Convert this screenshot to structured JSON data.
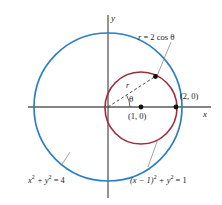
{
  "figure": {
    "axes": {
      "x_label": "x",
      "y_label": "y",
      "axis_color": "#5a5a5a",
      "origin": {
        "x": 108,
        "y": 107
      }
    },
    "curves": [
      {
        "name": "outer-circle",
        "equation": "x2 + y2 = 4",
        "equation_parts": {
          "lead": "x",
          "exp1": "2",
          "mid": " + y",
          "exp2": "2",
          "tail": " = 4"
        },
        "color": "#2b7fc4",
        "center": {
          "x": 108,
          "y": 107
        },
        "radius": 74
      },
      {
        "name": "inner-circle",
        "equation": "(x - 1)2 + y2 = 1",
        "equation_parts": {
          "lead": "(x − 1)",
          "exp1": "2",
          "mid": " + y",
          "exp2": "2",
          "tail": " = 1"
        },
        "color": "#a02a3c",
        "center": {
          "x": 141,
          "y": 108
        },
        "radius": 36
      }
    ],
    "polar_label": "r = 2 cos θ",
    "polar_label_parts": {
      "r": "r",
      "eq": " = 2 cos ",
      "theta": "θ"
    },
    "angle_symbol": "θ",
    "radius_symbol": "r",
    "points": [
      {
        "name": "center-point",
        "label": "(1, 0)",
        "x": 141,
        "y": 107
      },
      {
        "name": "intersection-point",
        "label": "(2, 0)",
        "x": 176,
        "y": 107
      },
      {
        "name": "ray-point",
        "label": "",
        "x": 155,
        "y": 77
      }
    ]
  }
}
